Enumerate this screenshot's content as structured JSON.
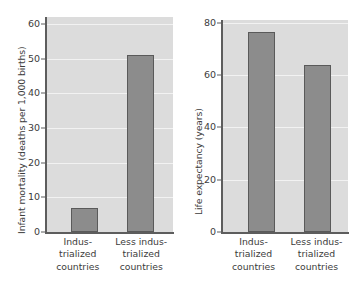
{
  "chart_data": [
    {
      "id": "infant-mortality",
      "type": "bar",
      "title": "",
      "xlabel": "",
      "ylabel": "Infant mortality (deaths per 1,000 births)",
      "categories": [
        "Industrialized countries",
        "Less industrialized countries"
      ],
      "category_lines": [
        [
          "Indus-",
          "trialized",
          "countries"
        ],
        [
          "Less indus-",
          "trialized",
          "countries"
        ]
      ],
      "values": [
        7,
        51
      ],
      "ylim": [
        0,
        62
      ],
      "yticks": [
        0,
        10,
        20,
        30,
        40,
        50,
        60
      ],
      "ytick_labels": [
        "0",
        "10",
        "20",
        "30",
        "40",
        "50",
        "60"
      ],
      "grid": true,
      "grid_axis": "y",
      "legend": "none",
      "bar_color": "#8c8c8c",
      "bar_edge_color": "#5a5a5a",
      "plot_background": "#dcdcdc",
      "gridline_color": "#f2f2f2",
      "axis_color": "#5d5d5d"
    },
    {
      "id": "life-expectancy",
      "type": "bar",
      "title": "",
      "xlabel": "",
      "ylabel": "Life expectancy (years)",
      "categories": [
        "Industrialized countries",
        "Less industrialized countries"
      ],
      "category_lines": [
        [
          "Indus-",
          "trialized",
          "countries"
        ],
        [
          "Less indus-",
          "trialized",
          "countries"
        ]
      ],
      "values": [
        76.5,
        64
      ],
      "ylim": [
        0,
        81
      ],
      "yticks": [
        0,
        20,
        40,
        60,
        80
      ],
      "ytick_labels": [
        "0",
        "20",
        "40",
        "60",
        "80"
      ],
      "grid": true,
      "grid_axis": "y",
      "legend": "none",
      "bar_color": "#8c8c8c",
      "bar_edge_color": "#5a5a5a",
      "plot_background": "#dcdcdc",
      "gridline_color": "#f2f2f2",
      "axis_color": "#5d5d5d"
    }
  ]
}
